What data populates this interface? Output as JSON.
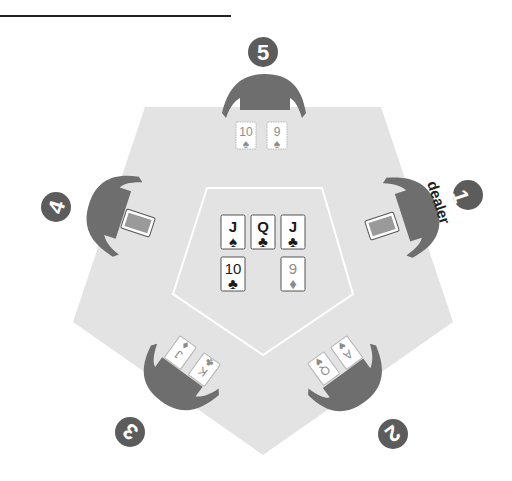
{
  "colors": {
    "table": "#e3e3e3",
    "table_line": "#ffffff",
    "player": "#6e6e6e",
    "badge": "#5c5c5c",
    "card_face": "#ffffff",
    "card_border": "#8a8a8a",
    "active_ink": "#1a1a1a",
    "faded_ink": "#8c8c8c",
    "card_back": "#9a9a9a",
    "title_rule": "#222222"
  },
  "board": {
    "cards": [
      {
        "rank": "J",
        "suit": "♠",
        "faded": false
      },
      {
        "rank": "Q",
        "suit": "♣",
        "faded": false
      },
      {
        "rank": "J",
        "suit": "♣",
        "faded": false
      },
      {
        "rank": "10",
        "suit": "♣",
        "faded": false
      },
      {
        "rank": "9",
        "suit": "♦",
        "faded": true
      }
    ]
  },
  "players": [
    {
      "seat": "1",
      "label": "dealer",
      "cards": "face-down"
    },
    {
      "seat": "2",
      "cards": [
        {
          "rank": "Q",
          "suit": "♥"
        },
        {
          "rank": "A",
          "suit": "♥"
        }
      ]
    },
    {
      "seat": "3",
      "cards": [
        {
          "rank": "J",
          "suit": "♦"
        },
        {
          "rank": "K",
          "suit": "♣"
        }
      ]
    },
    {
      "seat": "4",
      "cards": "face-down"
    },
    {
      "seat": "5",
      "cards": [
        {
          "rank": "10",
          "suit": "♠"
        },
        {
          "rank": "9",
          "suit": "♠"
        }
      ]
    }
  ]
}
